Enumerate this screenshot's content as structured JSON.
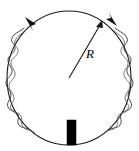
{
  "figure": {
    "type": "physics-diagram",
    "background_color": "#ffffff",
    "stroke_color": "#1a1a1a",
    "fill_color": "#000000",
    "labels": {
      "radius": "R"
    },
    "geometry": {
      "circle_center_x": 69,
      "circle_center_y": 78,
      "circle_radius_x": 62,
      "circle_radius_y": 67,
      "radius_arrow_start_x": 69,
      "radius_arrow_start_y": 78,
      "radius_arrow_end_x": 102,
      "radius_arrow_end_y": 22,
      "radius_label_x": 86,
      "radius_label_y": 57,
      "bar_x": 67,
      "bar_y": 120,
      "bar_width": 9,
      "bar_height": 25
    },
    "elements": {
      "loop_name": "circular-coil-loop",
      "coil_name": "coil-winding",
      "radius_arrow_name": "radius-arrow",
      "direction_arrow_left_name": "current-direction-arrow-left",
      "direction_arrow_right_name": "current-direction-arrow-right",
      "bar_name": "bar-element"
    }
  }
}
